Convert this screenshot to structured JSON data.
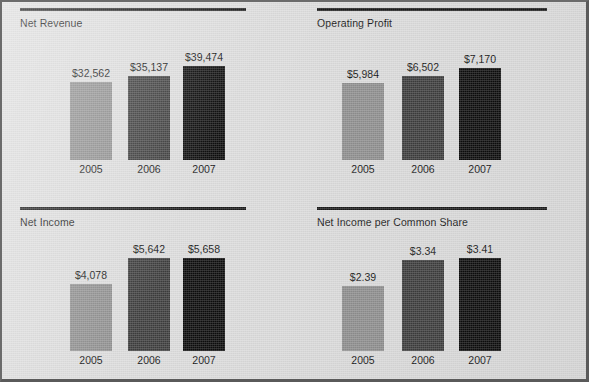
{
  "document": {
    "background_color": "#dcdcdc",
    "panel_rule_color": "#1a1a1a"
  },
  "series_colors": {
    "2005": "#8f8f8f",
    "2006": "#3d3d3d",
    "2007": "#0d0d0d"
  },
  "chart_data": [
    {
      "type": "bar",
      "title": "Net Revenue",
      "xlabel": "",
      "ylabel": "",
      "categories": [
        "2005",
        "2006",
        "2007"
      ],
      "values": [
        32562,
        35137,
        39474
      ],
      "value_labels": [
        "$32,562",
        "$35,137",
        "$39,474"
      ],
      "bar_colors": [
        "#8f8f8f",
        "#3d3d3d",
        "#0d0d0d"
      ],
      "grid": false,
      "legend": "none",
      "ylim": [
        0,
        47000
      ]
    },
    {
      "type": "bar",
      "title": "Operating Profit",
      "xlabel": "",
      "ylabel": "",
      "categories": [
        "2005",
        "2006",
        "2007"
      ],
      "values": [
        5984,
        6502,
        7170
      ],
      "value_labels": [
        "$5,984",
        "$6,502",
        "$7,170"
      ],
      "bar_colors": [
        "#8f8f8f",
        "#3d3d3d",
        "#0d0d0d"
      ],
      "grid": false,
      "legend": "none",
      "ylim": [
        0,
        8700
      ]
    },
    {
      "type": "bar",
      "title": "Net Income",
      "xlabel": "",
      "ylabel": "",
      "categories": [
        "2005",
        "2006",
        "2007"
      ],
      "values": [
        4078,
        5642,
        5658
      ],
      "value_labels": [
        "$4,078",
        "$5,642",
        "$5,658"
      ],
      "bar_colors": [
        "#8f8f8f",
        "#3d3d3d",
        "#0d0d0d"
      ],
      "grid": false,
      "legend": "none",
      "ylim": [
        0,
        6800
      ]
    },
    {
      "type": "bar",
      "title": "Net Income per Common Share",
      "xlabel": "",
      "ylabel": "",
      "categories": [
        "2005",
        "2006",
        "2007"
      ],
      "values": [
        2.39,
        3.34,
        3.41
      ],
      "value_labels": [
        "$2.39",
        "$3.34",
        "$3.41"
      ],
      "bar_colors": [
        "#8f8f8f",
        "#3d3d3d",
        "#0d0d0d"
      ],
      "grid": false,
      "legend": "none",
      "ylim": [
        0,
        4.1
      ]
    }
  ]
}
